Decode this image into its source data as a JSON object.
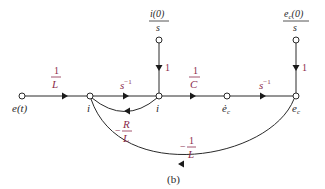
{
  "diagram": {
    "type": "signal-flow-graph",
    "caption": "(b)",
    "nodes": {
      "input": "e(t)",
      "i_dot": "i",
      "i": "i",
      "ec_dot": "ė",
      "ec_dot_sub": "c",
      "ec": "e",
      "ec_sub": "c"
    },
    "initial_conditions": {
      "i0_num": "i(0)",
      "i0_den": "s",
      "ec0_num": "e",
      "ec0_sub": "c",
      "ec0_num_tail": "(0)",
      "ec0_den": "s"
    },
    "gains": {
      "input_num": "1",
      "input_den": "L",
      "integrator1_base": "s",
      "integrator1_exp": "−1",
      "cap_num": "1",
      "cap_den": "C",
      "integrator2_base": "s",
      "integrator2_exp": "−1",
      "ic_i": "1",
      "ic_ec": "1",
      "feedback_R_sign": "−",
      "feedback_R_num": "R",
      "feedback_R_den": "L",
      "feedback_ec_sign": "−",
      "feedback_ec_num": "1",
      "feedback_ec_den": "L"
    }
  }
}
